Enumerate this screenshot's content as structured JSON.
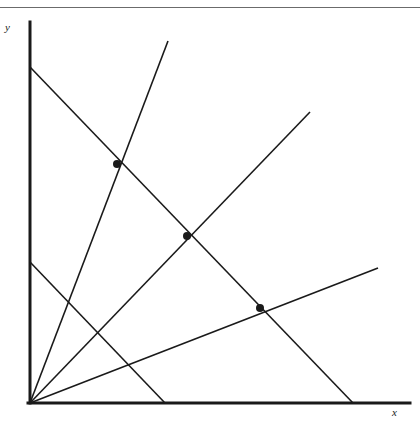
{
  "figure": {
    "title": "",
    "background_color": "#ffffff",
    "line_color": "#1a1a1a",
    "rule_color": "#6b6b6b",
    "width": 420,
    "height": 424
  },
  "axes": {
    "x_label": "x",
    "y_label": "y",
    "origin": [
      30,
      403
    ],
    "x_axis": {
      "from": [
        28,
        403
      ],
      "to": [
        410,
        403
      ],
      "stroke_width": 3
    },
    "y_axis": {
      "from": [
        30,
        22
      ],
      "to": [
        30,
        403
      ],
      "stroke_width": 3
    }
  },
  "chart_data": {
    "type": "line",
    "title": "",
    "xlabel": "x",
    "ylabel": "y",
    "grid": false,
    "legend": "none",
    "xlim": [
      0,
      420
    ],
    "ylim": [
      0,
      424
    ],
    "series": [
      {
        "name": "ray-steep",
        "kind": "ray-from-origin",
        "points": [
          [
            30,
            403
          ],
          [
            168,
            41
          ]
        ]
      },
      {
        "name": "ray-medium",
        "kind": "ray-from-origin",
        "points": [
          [
            30,
            403
          ],
          [
            310,
            112
          ]
        ]
      },
      {
        "name": "ray-shallow",
        "kind": "ray-from-origin",
        "points": [
          [
            30,
            403
          ],
          [
            378,
            268
          ]
        ]
      },
      {
        "name": "descending-long",
        "kind": "segment",
        "points": [
          [
            30,
            67
          ],
          [
            353,
            403
          ]
        ]
      },
      {
        "name": "descending-short",
        "kind": "segment",
        "points": [
          [
            30,
            262
          ],
          [
            165,
            403
          ]
        ]
      }
    ],
    "markers": [
      {
        "name": "intersection-1",
        "x": 117,
        "y": 164,
        "radius": 4
      },
      {
        "name": "intersection-2",
        "x": 187,
        "y": 236,
        "radius": 4
      },
      {
        "name": "intersection-3",
        "x": 260,
        "y": 308,
        "radius": 4
      }
    ]
  }
}
